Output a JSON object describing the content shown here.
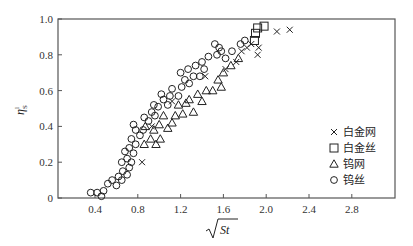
{
  "chart_data": {
    "type": "scatter",
    "title": "",
    "xlabel": "√St",
    "ylabel": "η^l_S",
    "xlim": [
      0.05,
      3.2
    ],
    "ylim": [
      0,
      1.0
    ],
    "xticks": [
      0.4,
      0.8,
      1.2,
      1.6,
      2.0,
      2.4,
      2.8
    ],
    "xtick_labels": [
      "0.4",
      "0.8",
      "1.2",
      "1.6",
      "2.0",
      "2.4",
      "2.8"
    ],
    "yticks": [
      0,
      0.2,
      0.4,
      0.6,
      0.8,
      1.0
    ],
    "ytick_labels": [
      "0",
      "0.2",
      "0.4",
      "0.6",
      "0.8",
      "1.0"
    ],
    "grid": false,
    "legend_position": "right-center inside",
    "series": [
      {
        "name": "白金网",
        "marker": "x",
        "points": [
          [
            0.84,
            0.2
          ],
          [
            0.93,
            0.4
          ],
          [
            1.12,
            0.54
          ],
          [
            1.43,
            0.68
          ],
          [
            1.72,
            0.76
          ],
          [
            1.62,
            0.72
          ],
          [
            1.77,
            0.82
          ],
          [
            1.82,
            0.84
          ],
          [
            1.86,
            0.86
          ],
          [
            1.92,
            0.8
          ],
          [
            1.93,
            0.84
          ],
          [
            2.1,
            0.93
          ],
          [
            2.22,
            0.94
          ]
        ]
      },
      {
        "name": "白金丝",
        "marker": "square",
        "points": [
          [
            1.89,
            0.88
          ],
          [
            1.9,
            0.92
          ],
          [
            1.92,
            0.95
          ],
          [
            1.98,
            0.96
          ]
        ]
      },
      {
        "name": "钨网",
        "marker": "triangle",
        "points": [
          [
            0.86,
            0.3
          ],
          [
            0.92,
            0.33
          ],
          [
            0.97,
            0.3
          ],
          [
            1.01,
            0.33
          ],
          [
            0.95,
            0.38
          ],
          [
            1.0,
            0.41
          ],
          [
            0.87,
            0.4
          ],
          [
            1.04,
            0.46
          ],
          [
            1.08,
            0.39
          ],
          [
            1.12,
            0.42
          ],
          [
            1.15,
            0.46
          ],
          [
            1.18,
            0.52
          ],
          [
            1.22,
            0.47
          ],
          [
            1.25,
            0.53
          ],
          [
            1.28,
            0.55
          ],
          [
            1.32,
            0.48
          ],
          [
            1.36,
            0.58
          ],
          [
            1.4,
            0.54
          ],
          [
            1.44,
            0.6
          ],
          [
            1.5,
            0.6
          ],
          [
            1.55,
            0.66
          ],
          [
            1.58,
            0.62
          ],
          [
            1.6,
            0.7
          ],
          [
            1.67,
            0.74
          ],
          [
            1.74,
            0.78
          ]
        ]
      },
      {
        "name": "钨丝",
        "marker": "circle",
        "points": [
          [
            0.36,
            0.03
          ],
          [
            0.42,
            0.03
          ],
          [
            0.46,
            0.01
          ],
          [
            0.48,
            0.04
          ],
          [
            0.52,
            0.08
          ],
          [
            0.56,
            0.1
          ],
          [
            0.6,
            0.07
          ],
          [
            0.62,
            0.12
          ],
          [
            0.65,
            0.1
          ],
          [
            0.66,
            0.15
          ],
          [
            0.7,
            0.13
          ],
          [
            0.72,
            0.17
          ],
          [
            0.65,
            0.2
          ],
          [
            0.7,
            0.22
          ],
          [
            0.74,
            0.2
          ],
          [
            0.68,
            0.26
          ],
          [
            0.72,
            0.28
          ],
          [
            0.76,
            0.25
          ],
          [
            0.78,
            0.3
          ],
          [
            0.74,
            0.33
          ],
          [
            0.78,
            0.38
          ],
          [
            0.76,
            0.41
          ],
          [
            0.82,
            0.35
          ],
          [
            0.85,
            0.38
          ],
          [
            0.9,
            0.43
          ],
          [
            0.86,
            0.45
          ],
          [
            0.93,
            0.48
          ],
          [
            0.96,
            0.46
          ],
          [
            0.99,
            0.51
          ],
          [
            0.95,
            0.52
          ],
          [
            1.04,
            0.55
          ],
          [
            1.08,
            0.52
          ],
          [
            1.02,
            0.58
          ],
          [
            1.1,
            0.57
          ],
          [
            1.12,
            0.61
          ],
          [
            1.18,
            0.57
          ],
          [
            1.21,
            0.62
          ],
          [
            1.24,
            0.66
          ],
          [
            1.2,
            0.7
          ],
          [
            1.28,
            0.64
          ],
          [
            1.32,
            0.68
          ],
          [
            1.27,
            0.72
          ],
          [
            1.34,
            0.74
          ],
          [
            1.38,
            0.68
          ],
          [
            1.42,
            0.72
          ],
          [
            1.4,
            0.76
          ],
          [
            1.46,
            0.79
          ],
          [
            1.54,
            0.8
          ],
          [
            1.58,
            0.82
          ],
          [
            1.52,
            0.86
          ],
          [
            1.56,
            0.84
          ],
          [
            1.62,
            0.78
          ],
          [
            1.68,
            0.82
          ],
          [
            1.76,
            0.86
          ],
          [
            1.8,
            0.88
          ]
        ]
      }
    ]
  },
  "legend": {
    "items": [
      {
        "symbol": "×",
        "label": "白金网"
      },
      {
        "symbol": "□",
        "label": "白金丝"
      },
      {
        "symbol": "△",
        "label": "钨网"
      },
      {
        "symbol": "○",
        "label": "钨丝"
      }
    ]
  },
  "axes": {
    "y_title_main": "η",
    "y_title_sup": "l",
    "y_title_sub": "S",
    "x_title_radicand": "St"
  },
  "colors": {
    "frame": "#555555",
    "marker": "#222222"
  }
}
